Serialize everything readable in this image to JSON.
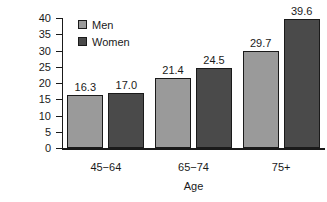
{
  "chart_data": {
    "type": "bar",
    "title": "",
    "xlabel": "Age",
    "ylabel": "Percent inactive",
    "categories": [
      "45−64",
      "65−74",
      "75+"
    ],
    "series": [
      {
        "name": "Men",
        "values": [
          16.3,
          21.4,
          29.7
        ],
        "color": "#9a9a9a"
      },
      {
        "name": "Women",
        "values": [
          17.0,
          24.5,
          39.6
        ],
        "color": "#4a4a4a"
      }
    ],
    "value_labels": [
      [
        "16.3",
        "21.4",
        "29.7"
      ],
      [
        "17.0",
        "24.5",
        "39.6"
      ]
    ],
    "ylim": [
      0,
      40
    ],
    "yticks": [
      0,
      5,
      10,
      15,
      20,
      25,
      30,
      35,
      40
    ],
    "ytick_labels": [
      "0",
      "5",
      "10",
      "15",
      "20",
      "25",
      "30",
      "35",
      "40"
    ],
    "grid": false,
    "legend_position": "upper-left-inside",
    "legend_entries": [
      "Men",
      "Women"
    ],
    "axis_color": "#1a1a1a",
    "background": "#ffffff"
  }
}
